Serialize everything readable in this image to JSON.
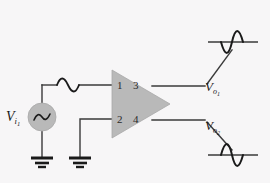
{
  "figure": {
    "type": "electronic-circuit-schematic",
    "background_color": "#f7f6f7",
    "wire_color": "#3a3a3a",
    "fill_color": "#b9b9b9",
    "waveform_color": "#1a1a1a"
  },
  "source": {
    "name": "ac-voltage-source",
    "label_main": "V",
    "label_sub": "i",
    "label_sub2": "1",
    "symbol": "sine-wave-glyph",
    "center_x": 42,
    "center_y": 117,
    "radius": 14
  },
  "amplifier": {
    "name": "amplifier-triangle",
    "shape": "triangle",
    "apex_x": 170,
    "apex_y": 104,
    "left_x": 112,
    "top_y": 70,
    "bottom_y": 138,
    "pins": [
      {
        "number": "1",
        "side": "input",
        "position": "top"
      },
      {
        "number": "2",
        "side": "input",
        "position": "bottom"
      },
      {
        "number": "3",
        "side": "output",
        "position": "top"
      },
      {
        "number": "4",
        "side": "output",
        "position": "bottom"
      }
    ]
  },
  "outputs": [
    {
      "name": "output-1",
      "label_main": "V",
      "label_sub": "o",
      "label_sub2": "1",
      "waveform": "sine-inverted",
      "waveform_x": 222,
      "waveform_y": 42
    },
    {
      "name": "output-2",
      "label_main": "V",
      "label_sub": "o",
      "label_sub2": "2",
      "waveform": "sine-normal",
      "waveform_x": 222,
      "waveform_y": 155
    }
  ],
  "input_waveform": {
    "name": "input-sine-waveform",
    "waveform": "sine-normal",
    "x": 57,
    "y": 85
  },
  "grounds": [
    {
      "name": "ground-source",
      "x": 42,
      "y": 160,
      "bars": 3
    },
    {
      "name": "ground-reference",
      "x": 80,
      "y": 160,
      "bars": 3
    }
  ]
}
